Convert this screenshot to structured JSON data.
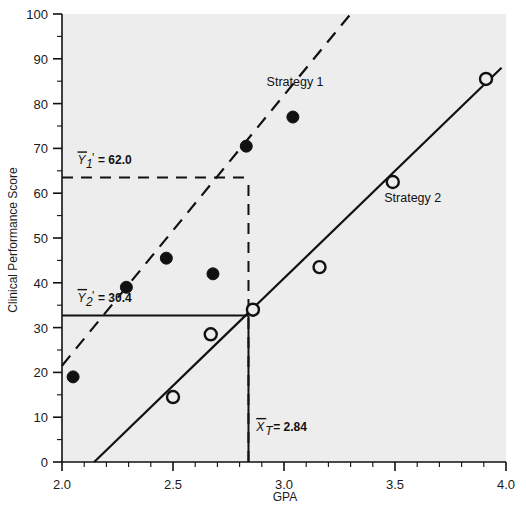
{
  "chart_data": {
    "type": "scatter",
    "title": "",
    "subtitle": "",
    "xlabel": "GPA",
    "ylabel": "Clinical Performance Score",
    "xlim": [
      2.0,
      4.0
    ],
    "ylim": [
      0,
      100
    ],
    "x_major_ticks": [
      2.0,
      2.5,
      3.0,
      3.5,
      4.0
    ],
    "x_tick_labels": [
      "2.0",
      "2.5",
      "3.0",
      "3.5",
      "4.0"
    ],
    "x_minor_step": 0.1,
    "y_major_ticks": [
      0,
      10,
      20,
      30,
      40,
      50,
      60,
      70,
      80,
      90,
      100
    ],
    "y_tick_labels": [
      "0",
      "10",
      "20",
      "30",
      "40",
      "50",
      "60",
      "70",
      "80",
      "90",
      "100"
    ],
    "y_minor_step": 5,
    "grid": false,
    "legend_position": "inline-annotations",
    "plot_background": "#ededed",
    "series": [
      {
        "name": "Strategy 1",
        "marker": "filled-circle",
        "line_style": "dashed",
        "color": "#111111",
        "points": [
          {
            "x": 2.05,
            "y": 19.0
          },
          {
            "x": 2.29,
            "y": 39.0
          },
          {
            "x": 2.47,
            "y": 45.5
          },
          {
            "x": 2.68,
            "y": 42.0
          },
          {
            "x": 2.83,
            "y": 70.5
          },
          {
            "x": 3.04,
            "y": 77.0
          }
        ],
        "fit_line": {
          "x1": 2.0,
          "y1": 21.5,
          "x2": 3.3,
          "y2": 100.0
        },
        "label_position": {
          "x": 3.05,
          "y": 84.0
        }
      },
      {
        "name": "Strategy 2",
        "marker": "open-circle",
        "line_style": "solid",
        "color": "#111111",
        "points": [
          {
            "x": 2.5,
            "y": 14.5
          },
          {
            "x": 2.67,
            "y": 28.5
          },
          {
            "x": 2.86,
            "y": 34.0
          },
          {
            "x": 3.16,
            "y": 43.5
          },
          {
            "x": 3.49,
            "y": 62.5
          },
          {
            "x": 3.91,
            "y": 85.5
          }
        ],
        "fit_line": {
          "x1": 2.145,
          "y1": 0.0,
          "x2": 3.98,
          "y2": 88.0
        },
        "label_position": {
          "x": 3.58,
          "y": 58.0
        }
      }
    ],
    "annotations": [
      {
        "name": "y1-mean-prediction",
        "text": "= 62.0",
        "symbol_base": "Y",
        "symbol_sub": "1",
        "symbol_prime": "'",
        "overbar": true,
        "value": 62.0,
        "guide": {
          "type": "dashed-horizontal",
          "y": 63.5,
          "x_from": 2.0,
          "x_to": 2.84
        },
        "label_x": 2.07,
        "label_y": 66.5
      },
      {
        "name": "y2-mean-prediction",
        "text": "= 30.4",
        "symbol_base": "Y",
        "symbol_sub": "2",
        "symbol_prime": "'",
        "overbar": true,
        "value": 30.4,
        "guide": {
          "type": "solid-horizontal",
          "y": 32.7,
          "x_from": 2.0,
          "x_to": 2.84
        },
        "label_x": 2.07,
        "label_y": 35.8
      },
      {
        "name": "x-total-mean",
        "text": "= 2.84",
        "symbol_base": "X",
        "symbol_sub": "T",
        "symbol_prime": "",
        "overbar": true,
        "value": 2.84,
        "guide": {
          "type": "vertical",
          "x": 2.84,
          "y_from": 0,
          "y_to": 63.5
        },
        "label_x": 2.875,
        "label_y": 7.0
      }
    ]
  },
  "colors": {
    "plot_bg": "#ededed",
    "ink": "#111111",
    "axis": "#1a1a1a",
    "page_bg": "#ffffff"
  }
}
